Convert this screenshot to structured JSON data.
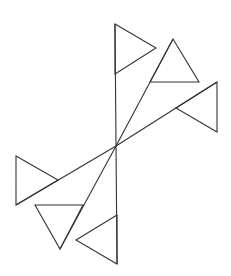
{
  "diagram": {
    "type": "geometric-figure",
    "stroke_color": "#333333",
    "background": "#ffffff",
    "center": [
      116,
      146
    ],
    "lines": [
      {
        "name": "vertical-axis",
        "from": [
          115,
          24
        ],
        "to": [
          117,
          264
        ]
      },
      {
        "name": "upper-right-diagonal",
        "from": [
          116,
          146
        ],
        "to": [
          173,
          39
        ]
      },
      {
        "name": "right-diagonal",
        "from": [
          116,
          146
        ],
        "to": [
          217,
          82
        ]
      },
      {
        "name": "left-diagonal",
        "from": [
          116,
          146
        ],
        "to": [
          16,
          205
        ]
      },
      {
        "name": "lower-left-diagonal",
        "from": [
          116,
          146
        ],
        "to": [
          60,
          249
        ]
      }
    ],
    "triangles": [
      {
        "name": "triangle-top",
        "points": [
          [
            115,
            24
          ],
          [
            156,
            48
          ],
          [
            115,
            74
          ]
        ]
      },
      {
        "name": "triangle-upper-right",
        "points": [
          [
            173,
            39
          ],
          [
            199,
            82
          ],
          [
            150,
            82
          ]
        ]
      },
      {
        "name": "triangle-right",
        "points": [
          [
            217,
            82
          ],
          [
            217,
            132
          ],
          [
            176,
            108
          ]
        ]
      },
      {
        "name": "triangle-left",
        "points": [
          [
            16,
            156
          ],
          [
            58,
            180
          ],
          [
            16,
            205
          ]
        ]
      },
      {
        "name": "triangle-lower-left",
        "points": [
          [
            35,
            205
          ],
          [
            83,
            205
          ],
          [
            60,
            249
          ]
        ]
      },
      {
        "name": "triangle-bottom",
        "points": [
          [
            117,
            215
          ],
          [
            117,
            264
          ],
          [
            76,
            240
          ]
        ]
      }
    ]
  }
}
